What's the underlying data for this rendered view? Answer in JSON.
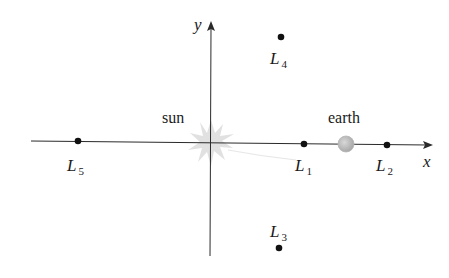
{
  "diagram": {
    "type": "lagrange-points",
    "axes": {
      "x_label": "x",
      "y_label": "y"
    },
    "bodies": {
      "sun": {
        "label": "sun",
        "color": "#d9d9d9"
      },
      "earth": {
        "label": "earth",
        "color": "#bdbdbd"
      }
    },
    "points": [
      {
        "id": "L1",
        "letter": "L",
        "sub": "1"
      },
      {
        "id": "L2",
        "letter": "L",
        "sub": "2"
      },
      {
        "id": "L3",
        "letter": "L",
        "sub": "3"
      },
      {
        "id": "L4",
        "letter": "L",
        "sub": "4"
      },
      {
        "id": "L5",
        "letter": "L",
        "sub": "5"
      }
    ],
    "colors": {
      "axis": "#2a2a2a",
      "point": "#111111",
      "background": "#ffffff"
    }
  }
}
